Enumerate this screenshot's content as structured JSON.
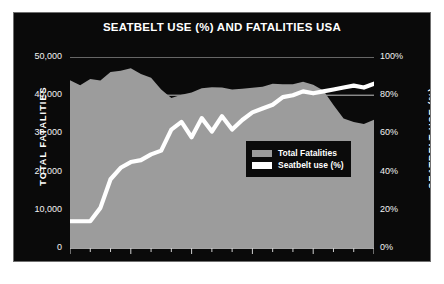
{
  "chart_data": {
    "type": "area",
    "title": "SEATBELT USE (%) AND FATALITIES USA",
    "xlabel": "",
    "ylabel": "TOTAL FATALITIES",
    "y2label": "SEATBELT USE (%)",
    "ylim": [
      0,
      50000
    ],
    "y2lim": [
      0,
      100
    ],
    "xlim": [
      1982,
      2012
    ],
    "grid": true,
    "legend_position": "center-right",
    "y_ticks": [
      "0",
      "10,000",
      "20,000",
      "30,000",
      "40,000",
      "50,000"
    ],
    "y_tick_values": [
      0,
      10000,
      20000,
      30000,
      40000,
      50000
    ],
    "y2_ticks": [
      "0%",
      "20%",
      "40%",
      "60%",
      "80%",
      "100%"
    ],
    "y2_tick_values": [
      0,
      20,
      40,
      60,
      80,
      100
    ],
    "x_ticks": [
      "1982",
      "1988",
      "1994",
      "2000",
      "2006",
      "2012"
    ],
    "x_tick_values": [
      1982,
      1988,
      1994,
      2000,
      2006,
      2012
    ],
    "x": [
      1982,
      1983,
      1984,
      1985,
      1986,
      1987,
      1988,
      1989,
      1990,
      1991,
      1992,
      1993,
      1994,
      1995,
      1996,
      1997,
      1998,
      1999,
      2000,
      2001,
      2002,
      2003,
      2004,
      2005,
      2006,
      2007,
      2008,
      2009,
      2010,
      2011,
      2012
    ],
    "series": [
      {
        "name": "Total Fatalities",
        "type": "area",
        "axis": "left",
        "color": "#9c9c9c",
        "values": [
          43945,
          42589,
          44257,
          43825,
          46087,
          46390,
          47087,
          45582,
          44599,
          41508,
          39250,
          40150,
          40716,
          41817,
          42065,
          42013,
          41501,
          41717,
          41945,
          42196,
          43005,
          42884,
          42836,
          43510,
          42708,
          41259,
          37423,
          33883,
          32999,
          32479,
          33561
        ]
      },
      {
        "name": "Seatbelt use (%)",
        "type": "line",
        "axis": "right",
        "color": "#ffffff",
        "values": [
          14,
          14,
          14,
          21,
          36,
          42,
          45,
          46,
          49,
          51,
          62,
          66,
          58,
          68,
          61,
          69,
          62,
          67,
          71,
          73,
          75,
          79,
          80,
          82,
          81,
          82,
          83,
          84,
          85,
          84,
          86
        ]
      }
    ]
  }
}
